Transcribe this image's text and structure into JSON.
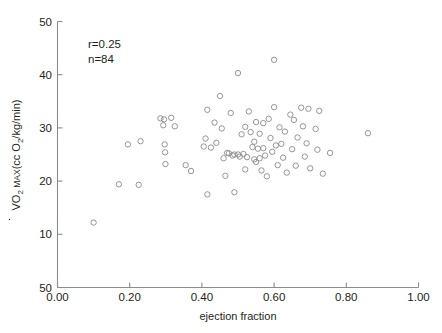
{
  "figure": {
    "background_color": "#ffffff",
    "axis_color": "#8c8c8c",
    "marker_color": "#8a8a8a",
    "text_color": "#231f20"
  },
  "annotations": {
    "correlation": "r=0.25",
    "sample_size": "n=84"
  },
  "axes": {
    "x_title": "ejection fraction",
    "y_title_main": "O",
    "y_title_dot": "V",
    "y_title_sub1": "2",
    "y_title_caps": " MAX",
    "y_title_rest": "(cc O",
    "y_title_sub2": "2",
    "y_title_tail": "/kg/min)",
    "x_tick_labels": [
      "0.00",
      "0.20",
      "0.40",
      "0.60",
      "0.80",
      "1.00"
    ],
    "y_tick_labels": [
      "50",
      "40",
      "30",
      "20",
      "10",
      "50"
    ]
  },
  "chart_data": {
    "type": "scatter",
    "title": "",
    "xlabel": "ejection fraction",
    "ylabel": "VO2 MAX (cc O2/kg/min)",
    "xlim": [
      0.0,
      1.0
    ],
    "ylim": [
      0,
      50
    ],
    "xticks": [
      0.0,
      0.2,
      0.4,
      0.6,
      0.8,
      1.0
    ],
    "yticks": [
      0,
      10,
      20,
      30,
      40,
      50
    ],
    "ytick_labels_as_drawn": [
      "50",
      "10",
      "20",
      "30",
      "40",
      "50"
    ],
    "grid": false,
    "legend": null,
    "marker": "open-circle",
    "marker_size": 3.4,
    "annotations": [
      "r=0.25",
      "n=84"
    ],
    "n_points": 84,
    "correlation_r": 0.25,
    "points": [
      [
        0.1,
        12.2
      ],
      [
        0.17,
        19.4
      ],
      [
        0.195,
        26.9
      ],
      [
        0.225,
        19.3
      ],
      [
        0.23,
        27.5
      ],
      [
        0.285,
        31.8
      ],
      [
        0.295,
        31.6
      ],
      [
        0.293,
        30.5
      ],
      [
        0.297,
        26.9
      ],
      [
        0.298,
        25.4
      ],
      [
        0.299,
        23.2
      ],
      [
        0.315,
        31.9
      ],
      [
        0.325,
        30.3
      ],
      [
        0.355,
        23.0
      ],
      [
        0.37,
        21.9
      ],
      [
        0.405,
        26.5
      ],
      [
        0.41,
        28.0
      ],
      [
        0.415,
        33.4
      ],
      [
        0.415,
        17.5
      ],
      [
        0.425,
        26.3
      ],
      [
        0.435,
        31.0
      ],
      [
        0.44,
        27.2
      ],
      [
        0.45,
        36.0
      ],
      [
        0.455,
        29.9
      ],
      [
        0.46,
        24.3
      ],
      [
        0.465,
        21.0
      ],
      [
        0.47,
        25.3
      ],
      [
        0.475,
        25.2
      ],
      [
        0.48,
        32.8
      ],
      [
        0.485,
        24.8
      ],
      [
        0.49,
        17.9
      ],
      [
        0.49,
        25.0
      ],
      [
        0.5,
        40.3
      ],
      [
        0.5,
        25.0
      ],
      [
        0.505,
        24.6
      ],
      [
        0.51,
        28.8
      ],
      [
        0.515,
        25.1
      ],
      [
        0.52,
        30.2
      ],
      [
        0.52,
        22.2
      ],
      [
        0.525,
        24.5
      ],
      [
        0.53,
        33.1
      ],
      [
        0.535,
        29.2
      ],
      [
        0.54,
        26.4
      ],
      [
        0.545,
        24.1
      ],
      [
        0.545,
        27.4
      ],
      [
        0.55,
        31.1
      ],
      [
        0.55,
        23.6
      ],
      [
        0.555,
        26.1
      ],
      [
        0.56,
        28.9
      ],
      [
        0.56,
        24.3
      ],
      [
        0.565,
        22.0
      ],
      [
        0.57,
        30.9
      ],
      [
        0.57,
        26.2
      ],
      [
        0.575,
        24.8
      ],
      [
        0.58,
        20.9
      ],
      [
        0.585,
        31.7
      ],
      [
        0.59,
        28.1
      ],
      [
        0.595,
        25.5
      ],
      [
        0.6,
        42.8
      ],
      [
        0.6,
        33.9
      ],
      [
        0.605,
        26.7
      ],
      [
        0.61,
        23.0
      ],
      [
        0.615,
        30.1
      ],
      [
        0.62,
        27.0
      ],
      [
        0.625,
        24.4
      ],
      [
        0.63,
        29.3
      ],
      [
        0.635,
        21.6
      ],
      [
        0.645,
        32.5
      ],
      [
        0.65,
        26.0
      ],
      [
        0.655,
        31.5
      ],
      [
        0.66,
        22.9
      ],
      [
        0.665,
        28.2
      ],
      [
        0.675,
        33.8
      ],
      [
        0.68,
        30.3
      ],
      [
        0.685,
        24.6
      ],
      [
        0.69,
        27.1
      ],
      [
        0.695,
        33.6
      ],
      [
        0.7,
        22.4
      ],
      [
        0.715,
        29.8
      ],
      [
        0.72,
        25.9
      ],
      [
        0.725,
        33.2
      ],
      [
        0.735,
        21.4
      ],
      [
        0.755,
        25.3
      ],
      [
        0.86,
        29.0
      ]
    ]
  }
}
